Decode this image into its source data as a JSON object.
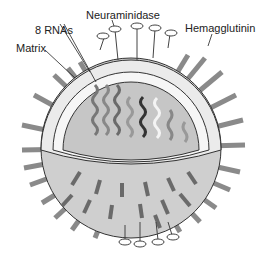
{
  "labels": {
    "rna": "8 RNAs",
    "neuraminidase": "Neuraminidase",
    "hemagglutinin": "Hemagglutinin",
    "matrix": "Matrix"
  },
  "colors": {
    "spike": "#8c8c8c",
    "spike_dark": "#5a5a5a",
    "membrane": "#ebebeb",
    "interior": "#c8c8c8",
    "outline": "#333333"
  },
  "rna_count": 8
}
